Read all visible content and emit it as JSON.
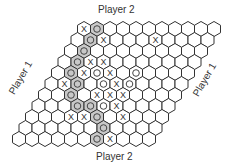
{
  "labels": {
    "top": "Player 2",
    "bottom": "Player 2",
    "left": "Player 1",
    "right": "Player 1"
  },
  "board": {
    "rows": 11,
    "cols": 11,
    "origin_x": 84,
    "origin_y": 29,
    "hex_width": 13,
    "row_height": 11,
    "row_shift": -6.5,
    "stroke_color": "#333333",
    "highlight_color": "#c8c8c8",
    "pieces": [
      {
        "row": 1,
        "col": 1,
        "mark": "X",
        "highlight": false
      },
      {
        "row": 1,
        "col": 2,
        "mark": "O",
        "highlight": true
      },
      {
        "row": 2,
        "col": 2,
        "mark": "O",
        "highlight": true
      },
      {
        "row": 2,
        "col": 3,
        "mark": "X",
        "highlight": false
      },
      {
        "row": 2,
        "col": 7,
        "mark": "X",
        "highlight": false
      },
      {
        "row": 3,
        "col": 2,
        "mark": "O",
        "highlight": true
      },
      {
        "row": 4,
        "col": 2,
        "mark": "O",
        "highlight": true
      },
      {
        "row": 4,
        "col": 3,
        "mark": "X",
        "highlight": false
      },
      {
        "row": 4,
        "col": 4,
        "mark": "X",
        "highlight": false
      },
      {
        "row": 5,
        "col": 2,
        "mark": "O",
        "highlight": true
      },
      {
        "row": 5,
        "col": 3,
        "mark": "X",
        "highlight": false
      },
      {
        "row": 5,
        "col": 4,
        "mark": "O",
        "highlight": false
      },
      {
        "row": 5,
        "col": 5,
        "mark": "X",
        "highlight": false
      },
      {
        "row": 5,
        "col": 7,
        "mark": "O",
        "highlight": false
      },
      {
        "row": 6,
        "col": 2,
        "mark": "X",
        "highlight": false
      },
      {
        "row": 6,
        "col": 3,
        "mark": "O",
        "highlight": true
      },
      {
        "row": 6,
        "col": 5,
        "mark": "O",
        "highlight": false
      },
      {
        "row": 6,
        "col": 6,
        "mark": "X",
        "highlight": false
      },
      {
        "row": 6,
        "col": 7,
        "mark": "O",
        "highlight": false
      },
      {
        "row": 7,
        "col": 3,
        "mark": "O",
        "highlight": true
      },
      {
        "row": 7,
        "col": 5,
        "mark": "X",
        "highlight": false
      },
      {
        "row": 7,
        "col": 6,
        "mark": "X",
        "highlight": false
      },
      {
        "row": 7,
        "col": 7,
        "mark": "X",
        "highlight": false
      },
      {
        "row": 8,
        "col": 4,
        "mark": "O",
        "highlight": true
      },
      {
        "row": 8,
        "col": 5,
        "mark": "O",
        "highlight": true
      },
      {
        "row": 8,
        "col": 6,
        "mark": "O",
        "highlight": false
      },
      {
        "row": 8,
        "col": 7,
        "mark": "X",
        "highlight": false
      },
      {
        "row": 9,
        "col": 4,
        "mark": "X",
        "highlight": false
      },
      {
        "row": 9,
        "col": 5,
        "mark": "X",
        "highlight": false
      },
      {
        "row": 9,
        "col": 6,
        "mark": "O",
        "highlight": true
      },
      {
        "row": 9,
        "col": 8,
        "mark": "X",
        "highlight": false
      },
      {
        "row": 10,
        "col": 7,
        "mark": "O",
        "highlight": true
      },
      {
        "row": 11,
        "col": 7,
        "mark": "O",
        "highlight": true
      },
      {
        "row": 11,
        "col": 8,
        "mark": "X",
        "highlight": false
      }
    ]
  }
}
